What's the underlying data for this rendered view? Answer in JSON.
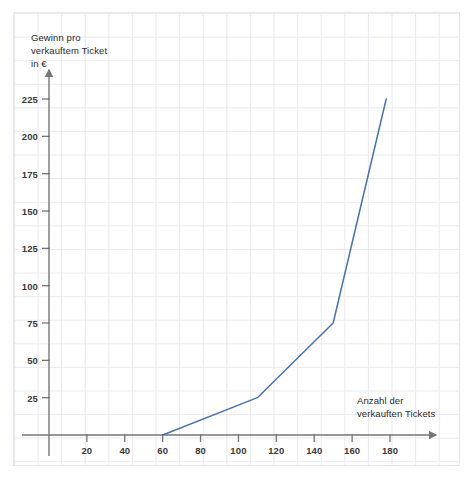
{
  "chart_data": {
    "type": "line",
    "title": "",
    "xlabel": "Anzahl der verkauften Tickets",
    "ylabel": "Gewinn pro verkauftem Ticket in €",
    "ylabel_lines": [
      "Gewinn pro",
      "verkauftem Ticket",
      "in €"
    ],
    "xlabel_lines": [
      "Anzahl der",
      "verkauften Tickets"
    ],
    "xlim": [
      0,
      192
    ],
    "ylim": [
      0,
      250
    ],
    "grid": true,
    "legend": "none",
    "xticks": [
      20,
      40,
      60,
      80,
      100,
      120,
      140,
      160,
      180
    ],
    "xtick_labels": [
      "20",
      "40",
      "60",
      "80",
      "100",
      "120",
      "140",
      "160",
      "180"
    ],
    "yticks": [
      25,
      50,
      75,
      100,
      125,
      150,
      175,
      200,
      225
    ],
    "ytick_labels": [
      "25",
      "50",
      "75",
      "100",
      "125",
      "150",
      "175",
      "200",
      "225"
    ],
    "series": [
      {
        "name": "Gewinn pro verkauftem Ticket",
        "color": "#4a72ab",
        "points": [
          {
            "x": 60,
            "y": 0
          },
          {
            "x": 110,
            "y": 25
          },
          {
            "x": 150,
            "y": 75
          },
          {
            "x": 178,
            "y": 225
          }
        ]
      }
    ]
  },
  "colors": {
    "line": "#4a72ab",
    "axis": "#767676",
    "grid": "#e9e9ef",
    "text": "#2b2b2b"
  }
}
